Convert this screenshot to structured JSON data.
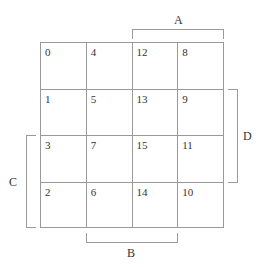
{
  "diagram": {
    "type": "karnaugh-map",
    "rows": [
      [
        "0",
        "4",
        "12",
        "8"
      ],
      [
        "1",
        "5",
        "13",
        "9"
      ],
      [
        "3",
        "7",
        "15",
        "11"
      ],
      [
        "2",
        "6",
        "14",
        "10"
      ]
    ],
    "labels": {
      "A": "A",
      "B": "B",
      "C": "C",
      "D": "D"
    },
    "colors": {
      "line": "#9a9a9a",
      "text": "#333333",
      "background": "#ffffff"
    }
  }
}
